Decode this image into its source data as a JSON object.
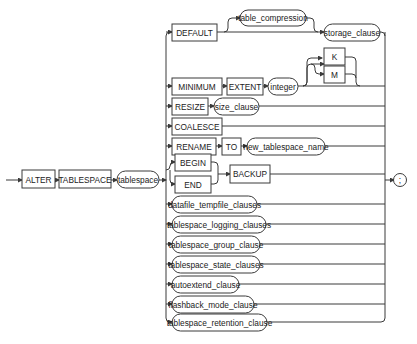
{
  "diagram": {
    "main_path": {
      "keyword_alter": "ALTER",
      "keyword_tablespace": "TABLESPACE",
      "tablespace_param": "tablespace",
      "terminator": ";"
    },
    "branches": {
      "default": {
        "keyword": "DEFAULT",
        "optional_param": "table_compression",
        "param": "storage_clause"
      },
      "minimum_extent": {
        "keyword_minimum": "MINIMUM",
        "keyword_extent": "EXTENT",
        "param": "integer",
        "unit_k": "K",
        "unit_m": "M"
      },
      "resize": {
        "keyword": "RESIZE",
        "param": "size_clause"
      },
      "coalesce": {
        "keyword": "COALESCE"
      },
      "rename": {
        "keyword_rename": "RENAME",
        "keyword_to": "TO",
        "param": "new_tablespace_name"
      },
      "backup": {
        "keyword_begin": "BEGIN",
        "keyword_end": "END",
        "keyword_backup": "BACKUP"
      },
      "clauses": [
        "datafile_tempfile_clauses",
        "tablespace_logging_clauses",
        "tablespace_group_clause",
        "tablespace_state_clauses",
        "autoextend_clause",
        "flashback_mode_clause",
        "tablespace_retention_clause"
      ]
    }
  }
}
